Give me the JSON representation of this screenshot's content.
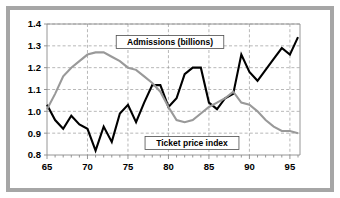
{
  "chart_data": {
    "type": "line",
    "title": "",
    "xlabel": "",
    "ylabel": "",
    "xlim": [
      65,
      96
    ],
    "ylim": [
      0.8,
      1.4
    ],
    "grid": true,
    "legend_position": "inline-annotations",
    "y_ticks": [
      "1.4",
      "1.3",
      "1.2",
      "1.1",
      "1.0",
      "0.9",
      "0.8"
    ],
    "y_tick_values": [
      1.4,
      1.3,
      1.2,
      1.1,
      1.0,
      0.9,
      0.8
    ],
    "x_ticks": [
      "65",
      "70",
      "75",
      "80",
      "85",
      "90",
      "95"
    ],
    "x_tick_values": [
      65,
      70,
      75,
      80,
      85,
      90,
      95
    ],
    "x": [
      65,
      66,
      67,
      68,
      69,
      70,
      71,
      72,
      73,
      74,
      75,
      76,
      77,
      78,
      79,
      80,
      81,
      82,
      83,
      84,
      85,
      86,
      87,
      88,
      89,
      90,
      91,
      92,
      93,
      94,
      95,
      96
    ],
    "series": [
      {
        "name": "Admissions (billions)",
        "color": "#000000",
        "values": [
          1.03,
          0.96,
          0.92,
          0.98,
          0.94,
          0.92,
          0.82,
          0.93,
          0.86,
          0.99,
          1.03,
          0.95,
          1.04,
          1.12,
          1.12,
          1.02,
          1.06,
          1.17,
          1.2,
          1.2,
          1.04,
          1.01,
          1.06,
          1.08,
          1.26,
          1.18,
          1.14,
          1.19,
          1.24,
          1.29,
          1.26,
          1.34
        ]
      },
      {
        "name": "Ticket price index",
        "color": "#999999",
        "values": [
          1.01,
          1.08,
          1.16,
          1.2,
          1.23,
          1.26,
          1.27,
          1.27,
          1.25,
          1.23,
          1.2,
          1.19,
          1.16,
          1.13,
          1.09,
          1.02,
          0.96,
          0.95,
          0.96,
          0.99,
          1.02,
          1.04,
          1.06,
          1.09,
          1.04,
          1.03,
          1.0,
          0.96,
          0.93,
          0.91,
          0.91,
          0.9
        ]
      }
    ],
    "annotations": [
      {
        "name": "admissions-label",
        "text": "Admissions (billions)",
        "x_px": 170,
        "y_px": 42
      },
      {
        "name": "ticket-price-label",
        "text": "Ticket price index",
        "x_px": 192,
        "y_px": 143
      }
    ]
  }
}
